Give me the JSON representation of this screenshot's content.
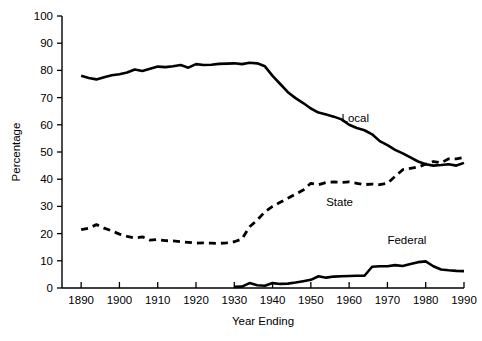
{
  "chart_data": {
    "type": "line",
    "title": "",
    "subtitle": "",
    "xlabel": "Year Ending",
    "ylabel": "Percentage",
    "xlim": [
      1885,
      1990
    ],
    "ylim": [
      0,
      100
    ],
    "xticks": [
      1890,
      1900,
      1910,
      1920,
      1930,
      1940,
      1950,
      1960,
      1970,
      1980,
      1990
    ],
    "yticks": [
      0,
      10,
      20,
      30,
      40,
      50,
      60,
      70,
      80,
      90,
      100
    ],
    "grid": false,
    "legend_position": "inline-annotations",
    "series": [
      {
        "name": "Local",
        "style": "solid",
        "color": "#000000",
        "label_x": 1958,
        "label_y": 61,
        "x": [
          1890,
          1892,
          1894,
          1896,
          1898,
          1900,
          1902,
          1904,
          1906,
          1908,
          1910,
          1912,
          1914,
          1916,
          1918,
          1920,
          1922,
          1924,
          1926,
          1928,
          1930,
          1932,
          1934,
          1936,
          1938,
          1940,
          1942,
          1944,
          1946,
          1948,
          1950,
          1952,
          1954,
          1956,
          1958,
          1960,
          1962,
          1964,
          1966,
          1968,
          1970,
          1972,
          1974,
          1976,
          1978,
          1980,
          1982,
          1984,
          1986,
          1988,
          1990
        ],
        "y": [
          78.0,
          77.2,
          76.7,
          77.5,
          78.2,
          78.6,
          79.2,
          80.3,
          79.8,
          80.6,
          81.4,
          81.2,
          81.5,
          82.0,
          81.0,
          82.3,
          82.0,
          82.1,
          82.4,
          82.5,
          82.6,
          82.3,
          82.8,
          82.6,
          81.5,
          78.0,
          75.0,
          72.0,
          69.8,
          68.0,
          66.0,
          64.5,
          63.8,
          63.0,
          62.0,
          60.0,
          58.8,
          58.0,
          56.5,
          54.0,
          52.5,
          50.8,
          49.5,
          48.0,
          46.5,
          45.5,
          45.0,
          45.2,
          45.5,
          45.0,
          46.0
        ]
      },
      {
        "name": "State",
        "style": "dashed",
        "color": "#000000",
        "label_x": 1954,
        "label_y": 30,
        "x": [
          1890,
          1892,
          1894,
          1896,
          1898,
          1900,
          1902,
          1904,
          1906,
          1908,
          1910,
          1912,
          1914,
          1916,
          1918,
          1920,
          1922,
          1924,
          1926,
          1928,
          1930,
          1932,
          1934,
          1936,
          1938,
          1940,
          1942,
          1944,
          1946,
          1948,
          1950,
          1952,
          1954,
          1956,
          1958,
          1960,
          1962,
          1964,
          1966,
          1968,
          1970,
          1972,
          1974,
          1976,
          1978,
          1980,
          1982,
          1984,
          1986,
          1988,
          1990
        ],
        "y": [
          21.5,
          22.0,
          23.3,
          22.0,
          21.0,
          19.8,
          19.0,
          18.4,
          18.8,
          17.6,
          17.8,
          17.4,
          17.3,
          17.0,
          16.8,
          16.5,
          16.6,
          16.5,
          16.4,
          16.6,
          17.0,
          18.0,
          22.5,
          25.0,
          28.0,
          30.0,
          31.5,
          33.0,
          34.5,
          36.0,
          38.5,
          38.0,
          38.8,
          39.0,
          38.8,
          39.0,
          38.5,
          38.0,
          38.2,
          38.0,
          38.5,
          41.0,
          43.5,
          44.0,
          44.5,
          45.5,
          46.5,
          46.0,
          47.5,
          47.5,
          48.0
        ]
      },
      {
        "name": "Federal",
        "style": "solid",
        "color": "#000000",
        "label_x": 1970,
        "label_y": 16,
        "x": [
          1930,
          1932,
          1934,
          1936,
          1938,
          1940,
          1942,
          1944,
          1946,
          1948,
          1950,
          1952,
          1954,
          1956,
          1958,
          1960,
          1962,
          1964,
          1966,
          1968,
          1970,
          1972,
          1974,
          1976,
          1978,
          1980,
          1982,
          1984,
          1986,
          1988,
          1990
        ],
        "y": [
          0.4,
          0.5,
          1.8,
          1.0,
          0.8,
          1.8,
          1.5,
          1.6,
          2.0,
          2.5,
          3.0,
          4.3,
          3.8,
          4.2,
          4.3,
          4.4,
          4.5,
          4.5,
          7.8,
          8.0,
          8.0,
          8.4,
          8.1,
          8.8,
          9.5,
          9.8,
          8.0,
          6.8,
          6.5,
          6.3,
          6.2
        ]
      }
    ]
  }
}
